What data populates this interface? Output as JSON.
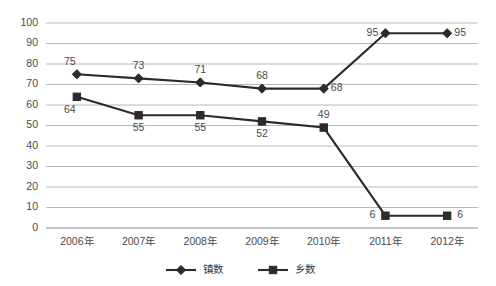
{
  "chart_data": {
    "type": "line",
    "title": "",
    "xlabel": "",
    "ylabel": "",
    "ylim": [
      0,
      100
    ],
    "ytick_step": 10,
    "grid": "horizontal",
    "legend_position": "bottom-center",
    "categories": [
      "2006年",
      "2007年",
      "2008年",
      "2009年",
      "2010年",
      "2011年",
      "2012年"
    ],
    "ytick_labels": [
      "100",
      "90",
      "80",
      "70",
      "60",
      "50",
      "40",
      "30",
      "20",
      "10",
      "0"
    ],
    "series": [
      {
        "name": "镇数",
        "marker": "diamond",
        "color": "#2b2b2b",
        "values": [
          75,
          73,
          71,
          68,
          68,
          95,
          95
        ],
        "labels": [
          "75",
          "73",
          "71",
          "68",
          "68",
          "95",
          "95"
        ],
        "label_placement": [
          "above-left",
          "above",
          "above",
          "above",
          "right",
          "left",
          "right"
        ]
      },
      {
        "name": "乡数",
        "marker": "square",
        "color": "#2b2b2b",
        "values": [
          64,
          55,
          55,
          52,
          49,
          6,
          6
        ],
        "labels": [
          "64",
          "55",
          "55",
          "52",
          "49",
          "6",
          "6"
        ],
        "label_placement": [
          "below-left",
          "below",
          "below",
          "below",
          "above",
          "left",
          "right"
        ]
      }
    ]
  },
  "legend": {
    "items": [
      {
        "label": "镇数",
        "marker": "diamond"
      },
      {
        "label": "乡数",
        "marker": "square"
      }
    ]
  }
}
